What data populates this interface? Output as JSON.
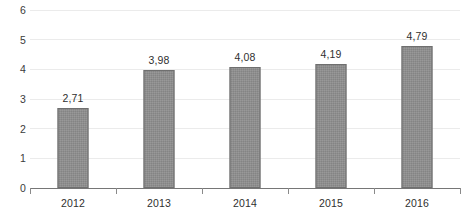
{
  "chart_data": {
    "type": "bar",
    "title": "",
    "subtitle": "",
    "xlabel": "",
    "ylabel": "",
    "categories": [
      "2012",
      "2013",
      "2014",
      "2015",
      "2016"
    ],
    "values": [
      2.71,
      3.98,
      4.08,
      4.19,
      4.79
    ],
    "value_labels": [
      "2,71",
      "3,98",
      "4,08",
      "4,19",
      "4,79"
    ],
    "ylim": [
      0,
      6
    ],
    "ytick_labels": [
      "0",
      "1",
      "2",
      "3",
      "4",
      "5",
      "6"
    ],
    "ytick_values": [
      0,
      1,
      2,
      3,
      4,
      5,
      6
    ],
    "grid": true,
    "grid_axis": "y",
    "legend": null,
    "legend_position": "none",
    "series": [
      {
        "name": "",
        "values": [
          2.71,
          3.98,
          4.08,
          4.19,
          4.79
        ],
        "color": "#8d8d8d"
      }
    ],
    "annotations": []
  },
  "colors": {
    "bar_fill": "#8d8d8d",
    "bar_border": "#6f6f6f",
    "gridline": "#ebebeb",
    "axis_line": "#767676",
    "tick_mark": "#8a8a8a",
    "label_text": "#2f2f2f",
    "axis_text": "#3b3b3b",
    "background": "#ffffff"
  }
}
